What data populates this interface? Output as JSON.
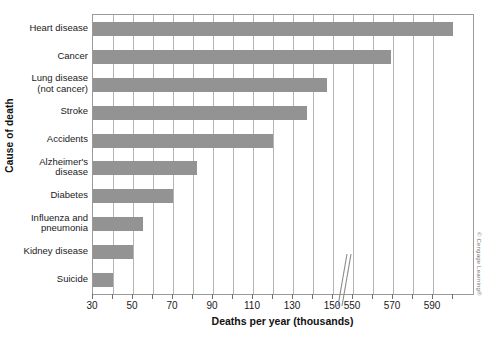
{
  "chart_data": {
    "type": "bar",
    "orientation": "horizontal",
    "title": "",
    "xlabel": "Deaths per year (thousands)",
    "ylabel": "Cause of death",
    "grid": true,
    "legend": null,
    "axis_break": {
      "after": 150,
      "before": 550,
      "marker": "double-slash"
    },
    "xlim_segment_1": [
      30,
      150
    ],
    "xlim_segment_2": [
      540,
      600
    ],
    "xticks_major": [
      30,
      50,
      70,
      90,
      110,
      130,
      150,
      550,
      570,
      590
    ],
    "xticks_minor_step": 10,
    "categories": [
      "Suicide",
      "Kidney disease",
      "Influenza and pneumonia",
      "Diabetes",
      "Alzheimer's disease",
      "Accidents",
      "Stroke",
      "Lung disease (not cancer)",
      "Cancer",
      "Heart disease"
    ],
    "category_labels_wrapped": [
      [
        "Suicide"
      ],
      [
        "Kidney disease"
      ],
      [
        "Influenza and",
        "pneumonia"
      ],
      [
        "Diabetes"
      ],
      [
        "Alzheimer's",
        "disease"
      ],
      [
        "Accidents"
      ],
      [
        "Stroke"
      ],
      [
        "Lung disease",
        "(not cancer)"
      ],
      [
        "Cancer"
      ],
      [
        "Heart disease"
      ]
    ],
    "values": [
      40,
      50,
      55,
      70,
      82,
      120,
      137,
      147,
      569,
      600
    ],
    "bar_color": "#939393"
  },
  "credit": "© Cengage Learning®"
}
